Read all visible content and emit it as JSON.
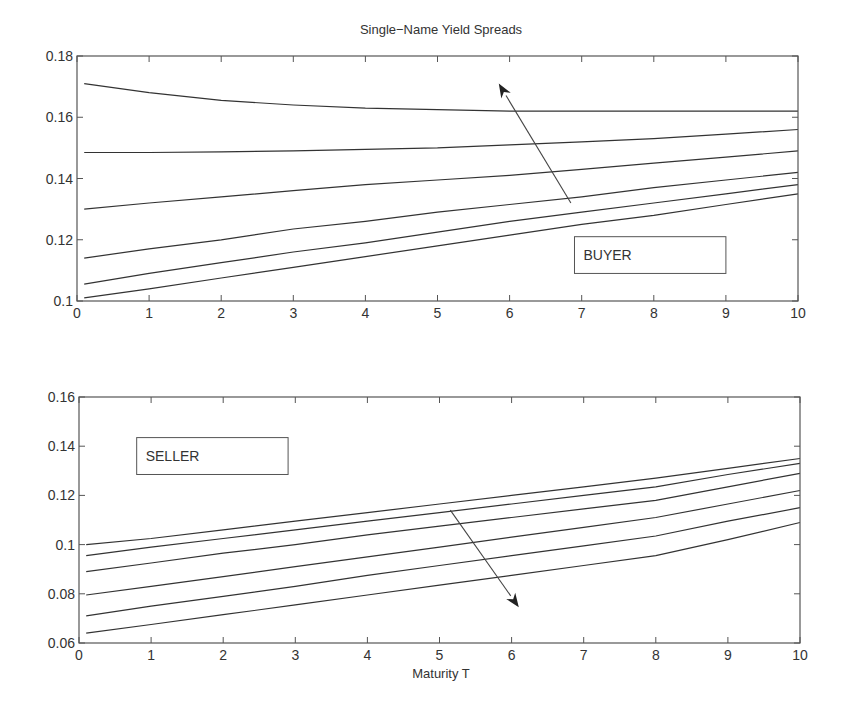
{
  "figure": {
    "title": "Single−Name Yield Spreads",
    "xlabel": "Maturity T"
  },
  "chart_data": [
    {
      "type": "line",
      "title": "Single−Name Yield Spreads",
      "xlabel": "",
      "ylabel": "",
      "xlim": [
        0,
        10
      ],
      "ylim": [
        0.1,
        0.18
      ],
      "xticks": [
        "0",
        "1",
        "2",
        "3",
        "4",
        "5",
        "6",
        "7",
        "8",
        "9",
        "10"
      ],
      "yticks": [
        "0.1",
        "0.12",
        "0.14",
        "0.16",
        "0.18"
      ],
      "grid": false,
      "annotation": {
        "label": "BUYER",
        "box_x": [
          6.9,
          9.0
        ],
        "box_y": [
          0.109,
          0.121
        ]
      },
      "arrow": {
        "from": [
          6.85,
          0.132
        ],
        "to": [
          5.85,
          0.171
        ],
        "meaning": "direction of increasing parameter"
      },
      "x": [
        0.1,
        1,
        2,
        3,
        4,
        5,
        6,
        7,
        8,
        9,
        10
      ],
      "series": [
        {
          "name": "curve 1",
          "values": [
            0.171,
            0.168,
            0.1655,
            0.164,
            0.163,
            0.1625,
            0.162,
            0.162,
            0.162,
            0.162,
            0.162
          ]
        },
        {
          "name": "curve 2",
          "values": [
            0.1485,
            0.1485,
            0.1487,
            0.149,
            0.1495,
            0.15,
            0.151,
            0.152,
            0.153,
            0.1545,
            0.156
          ]
        },
        {
          "name": "curve 3",
          "values": [
            0.13,
            0.132,
            0.134,
            0.136,
            0.138,
            0.1395,
            0.141,
            0.143,
            0.145,
            0.147,
            0.149
          ]
        },
        {
          "name": "curve 4",
          "values": [
            0.114,
            0.117,
            0.12,
            0.1235,
            0.126,
            0.129,
            0.1315,
            0.134,
            0.137,
            0.1395,
            0.142
          ]
        },
        {
          "name": "curve 5",
          "values": [
            0.1055,
            0.109,
            0.1125,
            0.116,
            0.119,
            0.1225,
            0.126,
            0.129,
            0.132,
            0.135,
            0.138
          ]
        },
        {
          "name": "curve 6",
          "values": [
            0.101,
            0.104,
            0.1075,
            0.111,
            0.1145,
            0.118,
            0.1215,
            0.125,
            0.128,
            0.1315,
            0.135
          ]
        }
      ]
    },
    {
      "type": "line",
      "title": "",
      "xlabel": "Maturity T",
      "ylabel": "",
      "xlim": [
        0,
        10
      ],
      "ylim": [
        0.06,
        0.16
      ],
      "xticks": [
        "0",
        "1",
        "2",
        "3",
        "4",
        "5",
        "6",
        "7",
        "8",
        "9",
        "10"
      ],
      "yticks": [
        "0.06",
        "0.08",
        "0.1",
        "0.12",
        "0.14",
        "0.16"
      ],
      "grid": false,
      "annotation": {
        "label": "SELLER",
        "box_x": [
          0.8,
          2.9
        ],
        "box_y": [
          0.1285,
          0.1435
        ]
      },
      "arrow": {
        "from": [
          5.15,
          0.114
        ],
        "to": [
          6.1,
          0.0745
        ],
        "meaning": "direction of increasing parameter"
      },
      "x": [
        0.1,
        1,
        2,
        3,
        4,
        5,
        6,
        7,
        8,
        9,
        10
      ],
      "series": [
        {
          "name": "curve 1",
          "values": [
            0.1,
            0.1025,
            0.106,
            0.1095,
            0.113,
            0.1165,
            0.12,
            0.1235,
            0.127,
            0.131,
            0.135
          ]
        },
        {
          "name": "curve 2",
          "values": [
            0.0955,
            0.099,
            0.1025,
            0.106,
            0.1095,
            0.113,
            0.1165,
            0.12,
            0.1235,
            0.1285,
            0.133
          ]
        },
        {
          "name": "curve 3",
          "values": [
            0.089,
            0.0925,
            0.0965,
            0.1,
            0.104,
            0.1075,
            0.111,
            0.1145,
            0.118,
            0.1235,
            0.129
          ]
        },
        {
          "name": "curve 4",
          "values": [
            0.0795,
            0.083,
            0.087,
            0.091,
            0.095,
            0.099,
            0.103,
            0.107,
            0.111,
            0.1165,
            0.122
          ]
        },
        {
          "name": "curve 5",
          "values": [
            0.071,
            0.075,
            0.079,
            0.083,
            0.0875,
            0.0915,
            0.0955,
            0.0995,
            0.1035,
            0.1095,
            0.115
          ]
        },
        {
          "name": "curve 6",
          "values": [
            0.064,
            0.0675,
            0.0715,
            0.0755,
            0.0795,
            0.0835,
            0.0875,
            0.0915,
            0.0955,
            0.102,
            0.109
          ]
        }
      ]
    }
  ],
  "layout": {
    "panels": [
      {
        "left": 77,
        "right": 798,
        "top": 56,
        "bottom": 301
      },
      {
        "left": 79,
        "right": 800,
        "top": 397,
        "bottom": 643
      }
    ]
  }
}
